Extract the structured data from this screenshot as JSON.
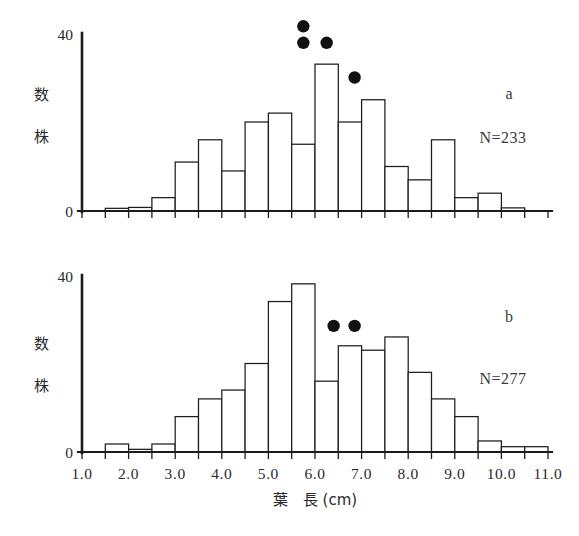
{
  "figure": {
    "axis": {
      "x_title_main": "葉　長",
      "x_title_unit": "(cm)",
      "x_title_full": "葉　長 (cm)",
      "y_title_chars": [
        "株",
        "数"
      ],
      "y_title_full": "株数",
      "x_tick_labels": [
        "1.0",
        "2.0",
        "3.0",
        "4.0",
        "5.0",
        "6.0",
        "7.0",
        "8.0",
        "9.0",
        "10.0",
        "11.0"
      ],
      "y_tick_labels": [
        "0",
        "40"
      ],
      "x_min": 1.0,
      "x_max": 11.0,
      "y_min": 0,
      "y_max": 40,
      "bin_width": 0.5,
      "minor_tick_step": 0.5
    },
    "panels": [
      {
        "letter": "a",
        "n_label": "N=233",
        "n_value": 233
      },
      {
        "letter": "b",
        "n_label": "N=277",
        "n_value": 277
      }
    ]
  },
  "chart_data": [
    {
      "id": "panel-a",
      "type": "bar",
      "title": "a",
      "subtitle": "N=233",
      "xlabel": "葉　長 (cm)",
      "ylabel": "株数",
      "xlim": [
        1.0,
        11.0
      ],
      "ylim": [
        0,
        40
      ],
      "grid": false,
      "legend": false,
      "bin_width": 0.5,
      "bin_starts": [
        1.0,
        1.5,
        2.0,
        2.5,
        3.0,
        3.5,
        4.0,
        4.5,
        5.0,
        5.5,
        6.0,
        6.5,
        7.0,
        7.5,
        8.0,
        8.5,
        9.0,
        9.5,
        10.0,
        10.5
      ],
      "bin_labels": [
        "1.0-1.5",
        "1.5-2.0",
        "2.0-2.5",
        "2.5-3.0",
        "3.0-3.5",
        "3.5-4.0",
        "4.0-4.5",
        "4.5-5.0",
        "5.0-5.5",
        "5.5-6.0",
        "6.0-6.5",
        "6.5-7.0",
        "7.0-7.5",
        "7.5-8.0",
        "8.0-8.5",
        "8.5-9.0",
        "9.0-9.5",
        "9.5-10.0",
        "10.0-10.5",
        "10.5-11.0"
      ],
      "values": [
        0,
        0.6,
        0.8,
        3,
        11,
        16,
        9,
        20,
        22,
        15,
        33,
        20,
        25,
        10,
        7,
        16,
        3,
        4,
        0.7,
        0
      ],
      "annotations": [
        {
          "marker": "dot",
          "x": 5.75,
          "y": 41.5,
          "bin_label": "5.5-6.0",
          "stack_index": 1
        },
        {
          "marker": "dot",
          "x": 5.75,
          "y": 37.8,
          "bin_label": "5.5-6.0",
          "stack_index": 0
        },
        {
          "marker": "dot",
          "x": 6.25,
          "y": 37.8,
          "bin_label": "6.0-6.5",
          "stack_index": 0
        },
        {
          "marker": "dot",
          "x": 6.85,
          "y": 30.0,
          "bin_label": "6.5-7.0",
          "stack_index": 0
        }
      ]
    },
    {
      "id": "panel-b",
      "type": "bar",
      "title": "b",
      "subtitle": "N=277",
      "xlabel": "葉　長 (cm)",
      "ylabel": "株数",
      "xlim": [
        1.0,
        11.0
      ],
      "ylim": [
        0,
        40
      ],
      "grid": false,
      "legend": false,
      "bin_width": 0.5,
      "bin_starts": [
        1.0,
        1.5,
        2.0,
        2.5,
        3.0,
        3.5,
        4.0,
        4.5,
        5.0,
        5.5,
        6.0,
        6.5,
        7.0,
        7.5,
        8.0,
        8.5,
        9.0,
        9.5,
        10.0,
        10.5
      ],
      "bin_labels": [
        "1.0-1.5",
        "1.5-2.0",
        "2.0-2.5",
        "2.5-3.0",
        "3.0-3.5",
        "3.5-4.0",
        "4.0-4.5",
        "4.5-5.0",
        "5.0-5.5",
        "5.5-6.0",
        "6.0-6.5",
        "6.5-7.0",
        "7.0-7.5",
        "7.5-8.0",
        "8.0-8.5",
        "8.5-9.0",
        "9.0-9.5",
        "9.5-10.0",
        "10.0-10.5",
        "10.5-11.0"
      ],
      "values": [
        0,
        1.8,
        0.6,
        1.8,
        8,
        12,
        14,
        20,
        34,
        38,
        16,
        24,
        23,
        26,
        18,
        12,
        8,
        2.5,
        1.2,
        1.2
      ],
      "annotations": [
        {
          "marker": "dot",
          "x": 6.4,
          "y": 28.5,
          "bin_label": "6.5-7.0",
          "stack_index": 0
        },
        {
          "marker": "dot",
          "x": 6.85,
          "y": 28.5,
          "bin_label": "7.0-7.5",
          "stack_index": 0
        }
      ]
    }
  ]
}
